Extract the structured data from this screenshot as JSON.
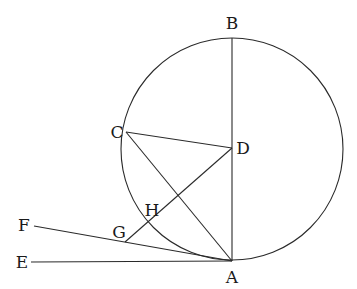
{
  "diagram": {
    "type": "geometry",
    "stroke_color": "#2a2a2a",
    "circle": {
      "name": "circle-center-D",
      "cx": 232,
      "cy": 149,
      "r": 111
    },
    "points": {
      "A": {
        "x": 232,
        "y": 261,
        "label": "A",
        "lx": 232,
        "ly": 283
      },
      "B": {
        "x": 232,
        "y": 38,
        "label": "B",
        "lx": 232,
        "ly": 29
      },
      "C": {
        "x": 126,
        "y": 132,
        "label": "C",
        "lx": 117,
        "ly": 138
      },
      "D": {
        "x": 232,
        "y": 148,
        "label": "D",
        "lx": 243,
        "ly": 154
      },
      "E": {
        "x": 31,
        "y": 262,
        "label": "E",
        "lx": 22,
        "ly": 268
      },
      "F": {
        "x": 34,
        "y": 226,
        "label": "F",
        "lx": 24,
        "ly": 231
      },
      "G": {
        "x": 125,
        "y": 242,
        "label": "G",
        "lx": 119,
        "ly": 238
      },
      "H": {
        "x": 149,
        "y": 219,
        "label": "H",
        "lx": 152,
        "ly": 216
      }
    },
    "segments": [
      {
        "name": "segment-BA",
        "from": "B",
        "to": "A"
      },
      {
        "name": "segment-CD",
        "from": "C",
        "to": "D"
      },
      {
        "name": "segment-CA",
        "from": "C",
        "to": "A"
      },
      {
        "name": "segment-DG",
        "from": "D",
        "to": "G"
      },
      {
        "name": "segment-FA",
        "from": "F",
        "to": "A"
      },
      {
        "name": "segment-EA",
        "from": "E",
        "to": "A"
      }
    ]
  }
}
